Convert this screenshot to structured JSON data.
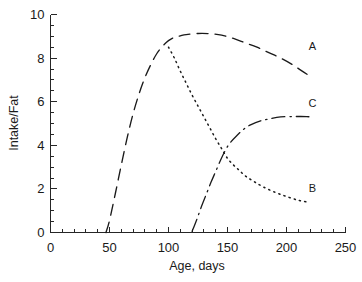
{
  "chart_data": {
    "type": "line",
    "title": "",
    "xlabel": "Age, days",
    "ylabel": "Intake/Fat",
    "xlim": [
      0,
      250
    ],
    "ylim": [
      0,
      10
    ],
    "grid": false,
    "legend_position": "inline-right",
    "x_ticks": [
      0,
      50,
      100,
      150,
      200,
      250
    ],
    "x_tick_labels": [
      "0",
      "50",
      "100",
      "150",
      "200",
      "250"
    ],
    "x_minor_step": 10,
    "y_ticks": [
      0,
      2,
      4,
      6,
      8,
      10
    ],
    "y_tick_labels": [
      "0",
      "2",
      "4",
      "6",
      "8",
      "10"
    ],
    "y_minor_step": 0.5,
    "series": [
      {
        "name": "A",
        "label": "A",
        "style": "dashed",
        "label_x": 222,
        "label_y": 8.55,
        "points": [
          [
            47,
            0.0
          ],
          [
            50,
            0.55
          ],
          [
            55,
            1.8
          ],
          [
            60,
            3.1
          ],
          [
            65,
            4.35
          ],
          [
            70,
            5.45
          ],
          [
            75,
            6.35
          ],
          [
            80,
            7.1
          ],
          [
            85,
            7.7
          ],
          [
            90,
            8.2
          ],
          [
            95,
            8.55
          ],
          [
            100,
            8.8
          ],
          [
            105,
            8.95
          ],
          [
            110,
            9.02
          ],
          [
            115,
            9.08
          ],
          [
            125,
            9.13
          ],
          [
            135,
            9.12
          ],
          [
            145,
            9.05
          ],
          [
            155,
            8.9
          ],
          [
            165,
            8.7
          ],
          [
            175,
            8.5
          ],
          [
            185,
            8.25
          ],
          [
            195,
            8.0
          ],
          [
            205,
            7.7
          ],
          [
            212,
            7.45
          ],
          [
            219,
            7.2
          ]
        ]
      },
      {
        "name": "B",
        "label": "B",
        "style": "dotted",
        "label_x": 222,
        "label_y": 2.05,
        "points": [
          [
            100,
            8.5
          ],
          [
            105,
            8.0
          ],
          [
            110,
            7.4
          ],
          [
            115,
            6.85
          ],
          [
            120,
            6.3
          ],
          [
            125,
            5.8
          ],
          [
            130,
            5.3
          ],
          [
            135,
            4.8
          ],
          [
            140,
            4.3
          ],
          [
            145,
            3.85
          ],
          [
            150,
            3.4
          ],
          [
            155,
            3.1
          ],
          [
            160,
            2.85
          ],
          [
            165,
            2.6
          ],
          [
            172,
            2.35
          ],
          [
            180,
            2.1
          ],
          [
            190,
            1.85
          ],
          [
            200,
            1.65
          ],
          [
            210,
            1.48
          ],
          [
            219,
            1.38
          ]
        ]
      },
      {
        "name": "C",
        "label": "C",
        "style": "dashdot",
        "label_x": 222,
        "label_y": 5.95,
        "points": [
          [
            120,
            0.05
          ],
          [
            124,
            0.6
          ],
          [
            128,
            1.2
          ],
          [
            132,
            1.75
          ],
          [
            136,
            2.3
          ],
          [
            140,
            2.8
          ],
          [
            144,
            3.3
          ],
          [
            148,
            3.75
          ],
          [
            152,
            4.1
          ],
          [
            158,
            4.45
          ],
          [
            164,
            4.75
          ],
          [
            170,
            4.95
          ],
          [
            178,
            5.12
          ],
          [
            186,
            5.22
          ],
          [
            195,
            5.3
          ],
          [
            205,
            5.32
          ],
          [
            212,
            5.32
          ],
          [
            219,
            5.31
          ]
        ]
      }
    ]
  },
  "axes": {
    "y_axis_title": "Intake/Fat",
    "x_axis_title": "Age, days"
  },
  "colors": {
    "ink": "#1a1a1a",
    "axis": "#262626",
    "background": "#ffffff"
  }
}
